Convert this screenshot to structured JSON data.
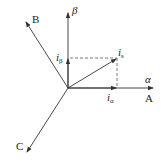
{
  "diagram": {
    "origin": {
      "x": 68,
      "y": 88
    },
    "axes": [
      {
        "id": "beta",
        "label": "β",
        "tip": {
          "x": 68,
          "y": 12
        }
      },
      {
        "id": "alpha",
        "label": "α",
        "tip": {
          "x": 154,
          "y": 88
        }
      },
      {
        "id": "A",
        "label": "A",
        "tip": {
          "x": 154,
          "y": 88
        }
      },
      {
        "id": "B",
        "label": "B",
        "tip": {
          "x": 25,
          "y": 21
        }
      },
      {
        "id": "C",
        "label": "C",
        "tip": {
          "x": 26,
          "y": 153
        }
      }
    ],
    "vectors": [
      {
        "id": "i_s",
        "label_main": "i",
        "label_sub": "s",
        "tip": {
          "x": 117,
          "y": 58
        }
      },
      {
        "id": "i_alpha",
        "label_main": "i",
        "label_sub": "α",
        "tip": {
          "x": 117,
          "y": 88
        }
      },
      {
        "id": "i_beta",
        "label_main": "i",
        "label_sub": "β",
        "tip": {
          "x": 68,
          "y": 58
        }
      }
    ],
    "labels": {
      "beta": "β",
      "alpha": "α",
      "A": "A",
      "B": "B",
      "C": "C",
      "i_main": "i",
      "s_sub": "s",
      "alpha_sub": "α",
      "beta_sub": "β"
    },
    "colors": {
      "line": "#333333",
      "dashed": "#555555"
    }
  }
}
